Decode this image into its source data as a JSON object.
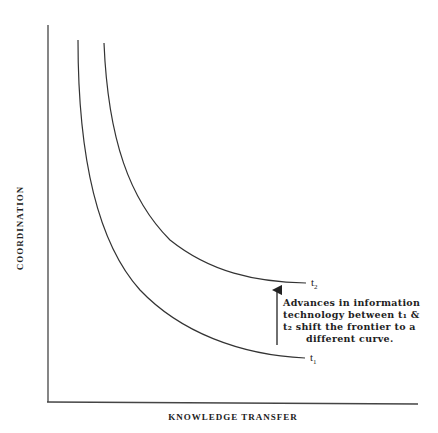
{
  "diagram": {
    "type": "frontier-shift",
    "axes": {
      "x_label": "KNOWLEDGE TRANSFER",
      "y_label": "COORDINATION"
    },
    "curves": [
      {
        "id": "t1",
        "label_main": "t",
        "label_sub": "1"
      },
      {
        "id": "t2",
        "label_main": "t",
        "label_sub": "2"
      }
    ],
    "annotation": {
      "lines": [
        "Advances in information",
        "technology between t₁ &",
        "t₂ shift the frontier to a",
        "different curve."
      ]
    },
    "colors": {
      "line": "#333333",
      "text": "#222222",
      "background": "#ffffff"
    }
  }
}
